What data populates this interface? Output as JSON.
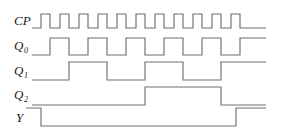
{
  "figure": {
    "kind": "digital-timing-diagram",
    "background_color": "#ffffff",
    "trace_color": "#6f6f6f",
    "label_color": "#1a1a1a"
  },
  "signals": [
    {
      "name": "CP",
      "label_main": "CP",
      "label_sub": "",
      "row_top_y": 14,
      "row_bottom_y": 28,
      "lead_in_x": 32,
      "start_level": 0,
      "edges_x": [
        41,
        50,
        60,
        69,
        79,
        88,
        98,
        107,
        117,
        126,
        136,
        145,
        155,
        164,
        174,
        183,
        193,
        202,
        212,
        221,
        231,
        240
      ],
      "end_x": 266
    },
    {
      "name": "Q0",
      "label_main": "Q",
      "label_sub": "0",
      "row_top_y": 38,
      "row_bottom_y": 55,
      "lead_in_x": 32,
      "start_level": 0,
      "edges_x": [
        50,
        69,
        88,
        107,
        126,
        145,
        164,
        183,
        202,
        221,
        240
      ],
      "end_x": 266
    },
    {
      "name": "Q1",
      "label_main": "Q",
      "label_sub": "1",
      "row_top_y": 62,
      "row_bottom_y": 80,
      "lead_in_x": 32,
      "start_level": 0,
      "edges_x": [
        69,
        107,
        145,
        183,
        221
      ],
      "end_x": 266
    },
    {
      "name": "Q2",
      "label_main": "Q",
      "label_sub": "2",
      "row_top_y": 87,
      "row_bottom_y": 105,
      "lead_in_x": 32,
      "start_level": 0,
      "edges_x": [
        145,
        221
      ],
      "end_x": 266
    },
    {
      "name": "Y",
      "label_main": "Y",
      "label_sub": "",
      "row_top_y": 108,
      "row_bottom_y": 126,
      "lead_in_x": 26,
      "start_level": 1,
      "edges_x": [
        41,
        236
      ],
      "end_x": 266
    }
  ],
  "labels": [
    {
      "text": "CP",
      "sub": "",
      "x": 14,
      "y": 26,
      "name": "label-cp"
    },
    {
      "text": "Q",
      "sub": "0",
      "x": 14,
      "y": 51,
      "name": "label-q0"
    },
    {
      "text": "Q",
      "sub": "1",
      "x": 14,
      "y": 76,
      "name": "label-q1"
    },
    {
      "text": "Q",
      "sub": "2",
      "x": 14,
      "y": 100,
      "name": "label-q2"
    },
    {
      "text": "Y",
      "sub": "",
      "x": 16,
      "y": 123,
      "name": "label-y"
    }
  ]
}
